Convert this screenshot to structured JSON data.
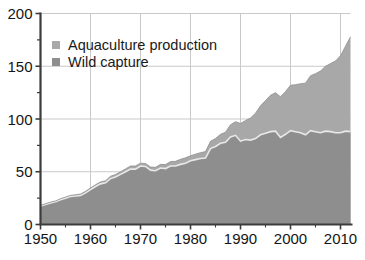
{
  "chart_data": {
    "type": "area",
    "stacked": true,
    "title": "",
    "subtitle": "",
    "xlabel": "",
    "ylabel": "",
    "xlim": [
      1950,
      2012
    ],
    "ylim": [
      0,
      200
    ],
    "grid": true,
    "grid_axis": "both",
    "legend_position": "top-left",
    "y_ticks_major": [
      0,
      50,
      100,
      150,
      200
    ],
    "y_ticks_minor": [
      25,
      75,
      125,
      175
    ],
    "y_tick_labels": [
      "0",
      "50",
      "100",
      "150",
      "200"
    ],
    "x_ticks": [
      1950,
      1960,
      1970,
      1980,
      1990,
      2000,
      2010
    ],
    "x_tick_labels": [
      "1950",
      "1960",
      "1970",
      "1980",
      "1990",
      "2000",
      "2010"
    ],
    "units": "million tonnes",
    "legend": [
      {
        "label": "Aquaculture production",
        "color": "#a8a8a8",
        "key": "aquaculture"
      },
      {
        "label": "Wild capture",
        "color": "#8e8e8e",
        "key": "wild_capture"
      }
    ],
    "x": [
      1950,
      1951,
      1952,
      1953,
      1954,
      1955,
      1956,
      1957,
      1958,
      1959,
      1960,
      1961,
      1962,
      1963,
      1964,
      1965,
      1966,
      1967,
      1968,
      1969,
      1970,
      1971,
      1972,
      1973,
      1974,
      1975,
      1976,
      1977,
      1978,
      1979,
      1980,
      1981,
      1982,
      1983,
      1984,
      1985,
      1986,
      1987,
      1988,
      1989,
      1990,
      1991,
      1992,
      1993,
      1994,
      1995,
      1996,
      1997,
      1998,
      1999,
      2000,
      2001,
      2002,
      2003,
      2004,
      2005,
      2006,
      2007,
      2008,
      2009,
      2010,
      2011,
      2012
    ],
    "series": [
      {
        "name": "Wild capture",
        "color": "#8e8e8e",
        "values": [
          17.5,
          19.0,
          20.5,
          21.5,
          23.5,
          25.0,
          26.5,
          27.0,
          27.5,
          30.0,
          33.0,
          36.0,
          38.5,
          39.5,
          43.5,
          45.0,
          47.5,
          50.0,
          52.5,
          52.5,
          55.5,
          55.0,
          51.5,
          51.0,
          53.5,
          53.0,
          55.5,
          55.5,
          57.0,
          58.0,
          60.5,
          61.5,
          62.5,
          63.0,
          72.0,
          74.0,
          77.0,
          78.0,
          83.0,
          84.5,
          79.0,
          80.5,
          80.0,
          81.5,
          85.0,
          86.5,
          88.0,
          88.5,
          82.5,
          85.5,
          89.0,
          88.0,
          87.0,
          85.0,
          89.0,
          88.0,
          87.0,
          88.5,
          88.0,
          87.0,
          87.0,
          88.5,
          88.0
        ]
      },
      {
        "name": "Aquaculture production",
        "color": "#a8a8a8",
        "values": [
          0.6,
          0.7,
          0.7,
          0.8,
          0.9,
          1.0,
          1.1,
          1.2,
          1.3,
          1.4,
          1.6,
          1.7,
          1.9,
          2.0,
          2.2,
          2.4,
          2.5,
          2.7,
          2.9,
          3.0,
          2.6,
          2.8,
          3.0,
          3.2,
          3.5,
          3.8,
          4.1,
          4.4,
          4.8,
          5.2,
          4.7,
          5.2,
          5.6,
          6.1,
          6.8,
          7.5,
          8.5,
          9.5,
          11.5,
          13.0,
          16.8,
          18.0,
          21.0,
          24.0,
          27.5,
          31.0,
          34.5,
          36.5,
          38.5,
          40.5,
          43.0,
          44.5,
          46.5,
          49.0,
          52.0,
          55.0,
          58.5,
          61.5,
          64.5,
          68.0,
          73.0,
          80.5,
          90.0
        ]
      }
    ],
    "totals": [
      18.1,
      19.7,
      21.2,
      22.3,
      24.4,
      26.0,
      27.6,
      28.2,
      28.8,
      31.4,
      34.6,
      37.7,
      40.4,
      41.5,
      45.7,
      47.4,
      50.0,
      52.7,
      55.4,
      55.5,
      58.1,
      57.8,
      54.5,
      54.2,
      57.0,
      56.8,
      59.6,
      59.9,
      61.8,
      63.2,
      65.2,
      66.7,
      68.1,
      69.1,
      78.8,
      81.5,
      85.5,
      87.5,
      94.5,
      97.5,
      95.8,
      98.5,
      101.0,
      105.5,
      112.5,
      117.5,
      122.5,
      125.0,
      121.0,
      126.0,
      132.0,
      132.5,
      133.5,
      134.0,
      141.0,
      143.0,
      145.5,
      150.0,
      152.5,
      155.0,
      160.0,
      169.0,
      178.0
    ]
  },
  "style": {
    "background": "#ffffff",
    "axis_color": "#3c3c3c",
    "grid_color": "#c9c9c9",
    "text_color": "#151515",
    "separator_color": "#e8e8e8"
  }
}
